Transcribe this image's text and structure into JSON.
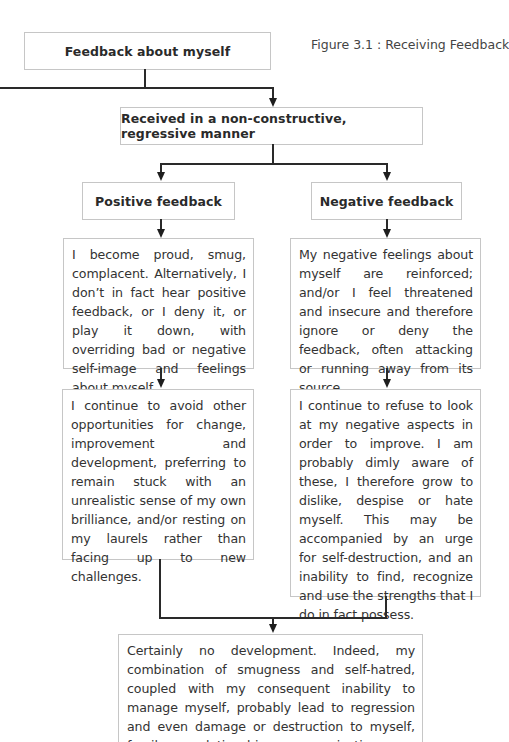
{
  "figure": {
    "caption": "Figure 3.1 : Receiving Feedback"
  },
  "nodes": {
    "feedback_about_myself": "Feedback about myself",
    "received_manner": "Received in a non-constructive, regressive manner",
    "positive_feedback": "Positive feedback",
    "negative_feedback": "Negative feedback",
    "positive_reaction": "I become proud, smug, complacent. Alternatively, I don’t in fact hear positive feedback, or I deny it, or play it down, with overriding bad or negative self-image and feelings about myself.",
    "negative_reaction": "My negative feelings about myself are reinforced; and/or I feel threatened and insecure and therefore ignore or deny the feedback, often attacking or running away from its source.",
    "positive_consequence": "I continue to avoid other opportunities for change, improvement and development, preferring to remain stuck with an unrealistic sense of my own brilliance, and/or resting on my laurels rather than facing up to new challenges.",
    "negative_consequence": "I continue to refuse to look at my negative aspects in order to improve. I am probably dimly aware of these, I therefore grow to dislike, despise or hate myself. This may be accompanied by an urge for self-destruction, and an inability to find, recognize and use the strengths that I do in fact possess.",
    "outcome": "Certainly no development. Indeed, my combination of smugness and self-hatred, coupled with my consequent inability to manage myself, probably lead to regression and even damage or destruction to myself, family, relationships, organization or community."
  },
  "colors": {
    "box_border": "#c6c6c6",
    "connector": "#2a2a2a",
    "text": "#333333"
  }
}
